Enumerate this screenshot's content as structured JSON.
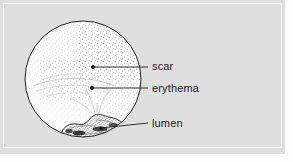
{
  "figure": {
    "kind": "anatomical-line-illustration",
    "background_color": "#dfdfdf",
    "ink_color": "#1c1c1c",
    "field_fill_color": "#fbfbfb"
  },
  "field": {
    "name": "circular-field",
    "center_x": 83,
    "center_y": 79,
    "radius": 58,
    "stipple_density": "graded, densest upper-right and around lumen"
  },
  "callouts": [
    {
      "id": "scar",
      "label": "scar",
      "marker_x": 93,
      "marker_y": 67,
      "leader_end_x": 148,
      "leader_end_y": 67
    },
    {
      "id": "erythema",
      "label": "erythema",
      "marker_x": 92,
      "marker_y": 88,
      "leader_end_x": 148,
      "leader_end_y": 88
    },
    {
      "id": "lumen",
      "label": "lumen",
      "marker_x": 101,
      "marker_y": 128,
      "leader_end_x": 148,
      "leader_end_y": 123
    }
  ],
  "labels": {
    "scar": "scar",
    "erythema": "erythema",
    "lumen": "lumen"
  }
}
